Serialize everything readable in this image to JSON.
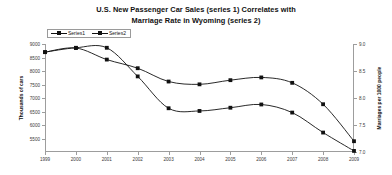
{
  "chart_data": {
    "type": "line",
    "title": "U.S. New Passenger Car Sales (series 1) Correlates with Marriage Rate in Wyoming (series 2)",
    "title_line1": "U.S. New Passenger Car Sales (series 1) Correlates with",
    "title_line2": "Marriage Rate in Wyoming (series 2)",
    "xlabel": "",
    "ylabel": "Thousands of cars",
    "y2label": "Marriages per 1000 people",
    "grid": false,
    "legend_position": "top-left",
    "x": [
      1999,
      2000,
      2001,
      2002,
      2003,
      2004,
      2005,
      2006,
      2007,
      2008,
      2009
    ],
    "categories": [
      "1999",
      "2000",
      "2001",
      "2002",
      "2003",
      "2004",
      "2005",
      "2006",
      "2007",
      "2008",
      "2009"
    ],
    "ylim": [
      5000,
      9000
    ],
    "yticks": [
      9000,
      8500,
      8000,
      7500,
      7000,
      6500,
      6000,
      5500
    ],
    "ytick_labels": [
      "9000",
      "8500",
      "8000",
      "7500",
      "7000",
      "6500",
      "6000",
      "5500"
    ],
    "y2lim": [
      7.0,
      9.0
    ],
    "y2ticks": [
      9.0,
      8.5,
      8.0,
      7.5,
      7.0
    ],
    "y2tick_labels": [
      "9.0",
      "8.5",
      "8.0",
      "7.5",
      "7.0"
    ],
    "series": [
      {
        "name": "Series1",
        "axis": "left",
        "values": [
          8697,
          8852,
          8423,
          8103,
          7610,
          7506,
          7660,
          7762,
          7562,
          6769,
          5400
        ]
      },
      {
        "name": "Series2",
        "axis": "right",
        "values": [
          8.85,
          8.93,
          8.93,
          8.4,
          7.81,
          7.76,
          7.82,
          7.88,
          7.73,
          7.36,
          7.02
        ]
      }
    ],
    "legend": [
      "Series1",
      "Series2"
    ],
    "colors": {
      "series1": "#111111",
      "series2": "#111111",
      "axis": "#9d9d9d",
      "text": "#3a3a3a",
      "title": "#111111",
      "background": "#ffffff"
    }
  }
}
